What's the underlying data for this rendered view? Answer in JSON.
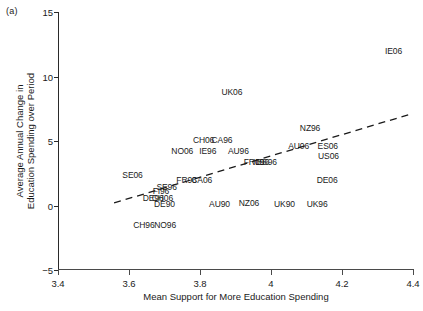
{
  "panel": {
    "tag": "(a)"
  },
  "chart_data": {
    "type": "scatter",
    "title": "",
    "xlabel": "Mean Support for More Education Spending",
    "ylabel_lines": [
      "Average Annual Change in",
      "Education Spending over Period"
    ],
    "xlim": [
      3.4,
      4.4
    ],
    "ylim": [
      -5,
      15
    ],
    "xticks": [
      3.4,
      3.6,
      3.8,
      4.0,
      4.2,
      4.4
    ],
    "xticklabels": [
      "3.4",
      "3.6",
      "3.8",
      "4",
      "4.2",
      "4.4"
    ],
    "yticks": [
      -5,
      0,
      5,
      10,
      15
    ],
    "yticklabels": [
      "-5",
      "0",
      "5",
      "10",
      "15"
    ],
    "grid": false,
    "legend": null,
    "marker_style": "text-label",
    "points": [
      {
        "label": "IE06",
        "x": 4.345,
        "y": 12.0
      },
      {
        "label": "UK06",
        "x": 3.89,
        "y": 8.8
      },
      {
        "label": "NZ96",
        "x": 4.11,
        "y": 6.0
      },
      {
        "label": "CH06",
        "x": 3.81,
        "y": 5.1
      },
      {
        "label": "CA96",
        "x": 3.862,
        "y": 5.1
      },
      {
        "label": "AU06",
        "x": 4.078,
        "y": 4.6
      },
      {
        "label": "ES06",
        "x": 4.16,
        "y": 4.6
      },
      {
        "label": "NO06",
        "x": 3.75,
        "y": 4.2
      },
      {
        "label": "IE96",
        "x": 3.822,
        "y": 4.2
      },
      {
        "label": "AU96",
        "x": 3.908,
        "y": 4.2
      },
      {
        "label": "US06",
        "x": 4.162,
        "y": 3.8
      },
      {
        "label": "FR06",
        "x": 3.952,
        "y": 3.4
      },
      {
        "label": "IL96",
        "x": 3.972,
        "y": 3.4
      },
      {
        "label": "ES96",
        "x": 3.988,
        "y": 3.4
      },
      {
        "label": "SE06",
        "x": 3.61,
        "y": 2.4
      },
      {
        "label": "FR96",
        "x": 3.762,
        "y": 2.0
      },
      {
        "label": "CA06",
        "x": 3.805,
        "y": 2.0
      },
      {
        "label": "DE06",
        "x": 4.158,
        "y": 2.0
      },
      {
        "label": "SE96",
        "x": 3.706,
        "y": 1.4
      },
      {
        "label": "FI96",
        "x": 3.69,
        "y": 1.1
      },
      {
        "label": "DE96",
        "x": 3.668,
        "y": 0.6
      },
      {
        "label": "CH06b",
        "x": 3.694,
        "y": 0.6
      },
      {
        "label": "DE90",
        "x": 3.7,
        "y": 0.1
      },
      {
        "label": "AU90",
        "x": 3.855,
        "y": 0.1
      },
      {
        "label": "NZ06",
        "x": 3.938,
        "y": 0.2
      },
      {
        "label": "UK90",
        "x": 4.038,
        "y": 0.1
      },
      {
        "label": "UK96",
        "x": 4.13,
        "y": 0.1
      },
      {
        "label": "CH96",
        "x": 3.642,
        "y": -1.5
      },
      {
        "label": "NO96",
        "x": 3.702,
        "y": -1.5
      }
    ],
    "trend_line": {
      "style": "dashed",
      "x_start": 3.558,
      "y_start": 0.2,
      "x_end": 4.395,
      "y_end": 7.1
    }
  }
}
